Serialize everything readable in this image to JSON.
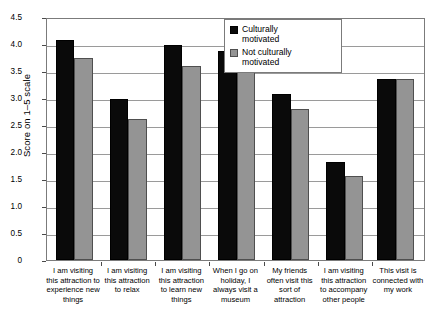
{
  "chart_data": {
    "type": "bar",
    "title": "",
    "xlabel": "",
    "ylabel": "Score on 1–5 scale",
    "ylim": [
      0,
      4.5
    ],
    "ytick_labels": [
      "0",
      "0.5",
      "1.0",
      "1.5",
      "2.0",
      "2.5",
      "3.0",
      "3.5",
      "4.0",
      "4.5"
    ],
    "ytick_values": [
      0,
      0.5,
      1.0,
      1.5,
      2.0,
      2.5,
      3.0,
      3.5,
      4.0,
      4.5
    ],
    "grid": true,
    "legend_position": "top-right",
    "categories": [
      "I am visiting this attraction to experience new things",
      "I am visiting this attraction to relax",
      "I am visiting this attraction to learn new things",
      "When I go on holiday, I always visit a museum",
      "My friends often visit this sort of attraction",
      "I am visiting this attraction to accompany other people",
      "This visit is connected with my work"
    ],
    "category_lines": [
      [
        "I am visiting",
        "this attraction to",
        "experience new",
        "things"
      ],
      [
        "I am visiting",
        "this attraction",
        "to relax"
      ],
      [
        "I am visiting",
        "this attraction",
        "to learn new",
        "things"
      ],
      [
        "When I go on",
        "holiday, I",
        "always visit a",
        "museum"
      ],
      [
        "My friends",
        "often visit this",
        "sort of",
        "attraction"
      ],
      [
        "I am visiting",
        "this attraction",
        "to accompany",
        "other people"
      ],
      [
        "This visit is",
        "connected with",
        "my work"
      ]
    ],
    "series": [
      {
        "name": "Culturally motivated",
        "color": "#0a0a0a",
        "values": [
          4.08,
          2.99,
          3.98,
          3.88,
          3.08,
          1.81,
          3.35
        ]
      },
      {
        "name": "Not culturally motivated",
        "color": "#949494",
        "values": [
          3.75,
          2.62,
          3.6,
          3.69,
          2.79,
          1.56,
          3.35
        ]
      }
    ]
  },
  "legend": {
    "items": [
      {
        "label_line1": "Culturally",
        "label_line2": "motivated",
        "swatch": "black"
      },
      {
        "label_line1": "Not culturally",
        "label_line2": "motivated",
        "swatch": "gray"
      }
    ]
  },
  "caption": ""
}
